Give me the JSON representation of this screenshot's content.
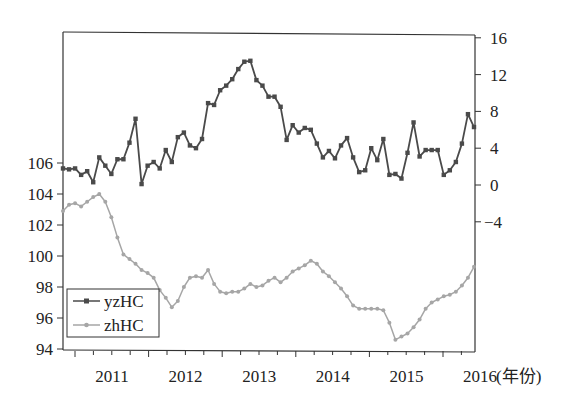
{
  "chart_data": {
    "type": "line",
    "title": "",
    "xlabel": "(年份)",
    "ylabel_left": "",
    "ylabel_right": "",
    "x_tick_labels": [
      "2011",
      "2012",
      "2013",
      "2014",
      "2015",
      "2016"
    ],
    "left_axis": {
      "ticks": [
        94,
        96,
        98,
        100,
        102,
        104,
        106
      ],
      "range": [
        94,
        109.5
      ]
    },
    "right_axis": {
      "ticks": [
        -4,
        0,
        4,
        8,
        12,
        16
      ],
      "range": [
        -18,
        16.5
      ]
    },
    "grid": false,
    "legend_position": "lower-left",
    "legend": [
      "yzHC",
      "zhHC"
    ],
    "x_start": "2010-11",
    "x_frequency": "monthly",
    "series": [
      {
        "name": "yzHC",
        "axis": "right",
        "color": "#4a4a4a",
        "marker": "square",
        "values": [
          1.8,
          1.7,
          1.8,
          1.1,
          1.5,
          0.3,
          3.0,
          2.1,
          1.2,
          2.8,
          2.8,
          4.6,
          7.2,
          0.1,
          2.1,
          2.5,
          1.8,
          3.8,
          2.5,
          5.2,
          5.7,
          4.3,
          4.0,
          5.0,
          8.9,
          8.7,
          10.3,
          10.8,
          11.5,
          12.6,
          13.4,
          13.5,
          11.4,
          10.8,
          9.6,
          9.6,
          8.5,
          4.9,
          6.5,
          5.7,
          6.2,
          6.0,
          4.5,
          3.0,
          3.7,
          2.9,
          4.3,
          5.1,
          3.0,
          1.4,
          1.6,
          4.0,
          2.7,
          5.0,
          1.1,
          1.2,
          0.7,
          3.5,
          6.8,
          3.1,
          3.8,
          3.8,
          3.8,
          1.1,
          1.6,
          2.5,
          4.5,
          7.7,
          6.3
        ]
      },
      {
        "name": "zhHC",
        "axis": "left",
        "color": "#a6a6a6",
        "marker": "circle",
        "values": [
          102.9,
          103.3,
          103.4,
          103.2,
          103.5,
          103.8,
          104.0,
          103.5,
          102.5,
          101.2,
          100.1,
          99.8,
          99.5,
          99.1,
          98.9,
          98.6,
          97.8,
          97.3,
          96.7,
          97.1,
          98.0,
          98.6,
          98.7,
          98.6,
          99.1,
          98.2,
          97.7,
          97.6,
          97.7,
          97.7,
          97.9,
          98.2,
          98.0,
          98.1,
          98.4,
          98.6,
          98.3,
          98.6,
          99.0,
          99.2,
          99.4,
          99.7,
          99.5,
          99.0,
          98.7,
          98.3,
          97.9,
          97.4,
          96.8,
          96.6,
          96.6,
          96.6,
          96.6,
          96.5,
          95.7,
          94.6,
          94.8,
          95.0,
          95.4,
          95.9,
          96.6,
          97.0,
          97.2,
          97.4,
          97.5,
          97.7,
          98.1,
          98.6,
          99.3
        ]
      }
    ]
  },
  "axes": {
    "left_ticks": [
      "106",
      "104",
      "102",
      "100",
      "98",
      "96",
      "94"
    ],
    "right_ticks": [
      "16",
      "12",
      "8",
      "4",
      "0",
      "−4"
    ],
    "x_ticks": [
      "2011",
      "2012",
      "2013",
      "2014",
      "2015",
      "2016"
    ],
    "x_unit": "(年份)"
  },
  "legend": {
    "items": [
      {
        "label": "yzHC",
        "color": "#4a4a4a"
      },
      {
        "label": "zhHC",
        "color": "#a6a6a6"
      }
    ]
  }
}
